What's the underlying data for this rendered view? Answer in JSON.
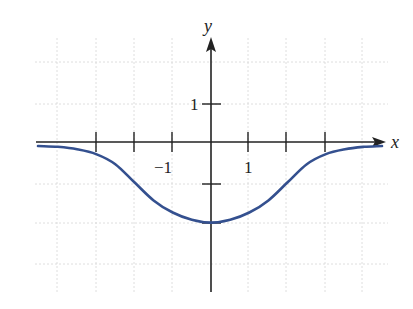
{
  "chart_data": {
    "type": "line",
    "title": "",
    "xlabel": "x",
    "ylabel": "y",
    "x_tick_labels": [
      "-1",
      "1"
    ],
    "y_tick_labels": [
      "1"
    ],
    "xlim": [
      -4.6,
      4.6
    ],
    "ylim": [
      -3.9,
      2.6
    ],
    "grid": true,
    "series": [
      {
        "name": "f(x)",
        "color": "#34508f",
        "x": [
          -4.5,
          -4,
          -3.5,
          -3,
          -2.5,
          -2,
          -1.5,
          -1,
          -0.5,
          0,
          0.5,
          1,
          1.5,
          2,
          2.5,
          3,
          3.5,
          4,
          4.5
        ],
        "y": [
          -0.1,
          -0.12,
          -0.18,
          -0.3,
          -0.55,
          -1.0,
          -1.45,
          -1.75,
          -1.93,
          -2.0,
          -1.93,
          -1.75,
          -1.45,
          -1.0,
          -0.55,
          -0.3,
          -0.18,
          -0.12,
          -0.1
        ]
      }
    ]
  },
  "labels": {
    "x_axis": "x",
    "y_axis": "y",
    "x_neg1": "−1",
    "x_pos1": "1",
    "y_pos1": "1"
  }
}
